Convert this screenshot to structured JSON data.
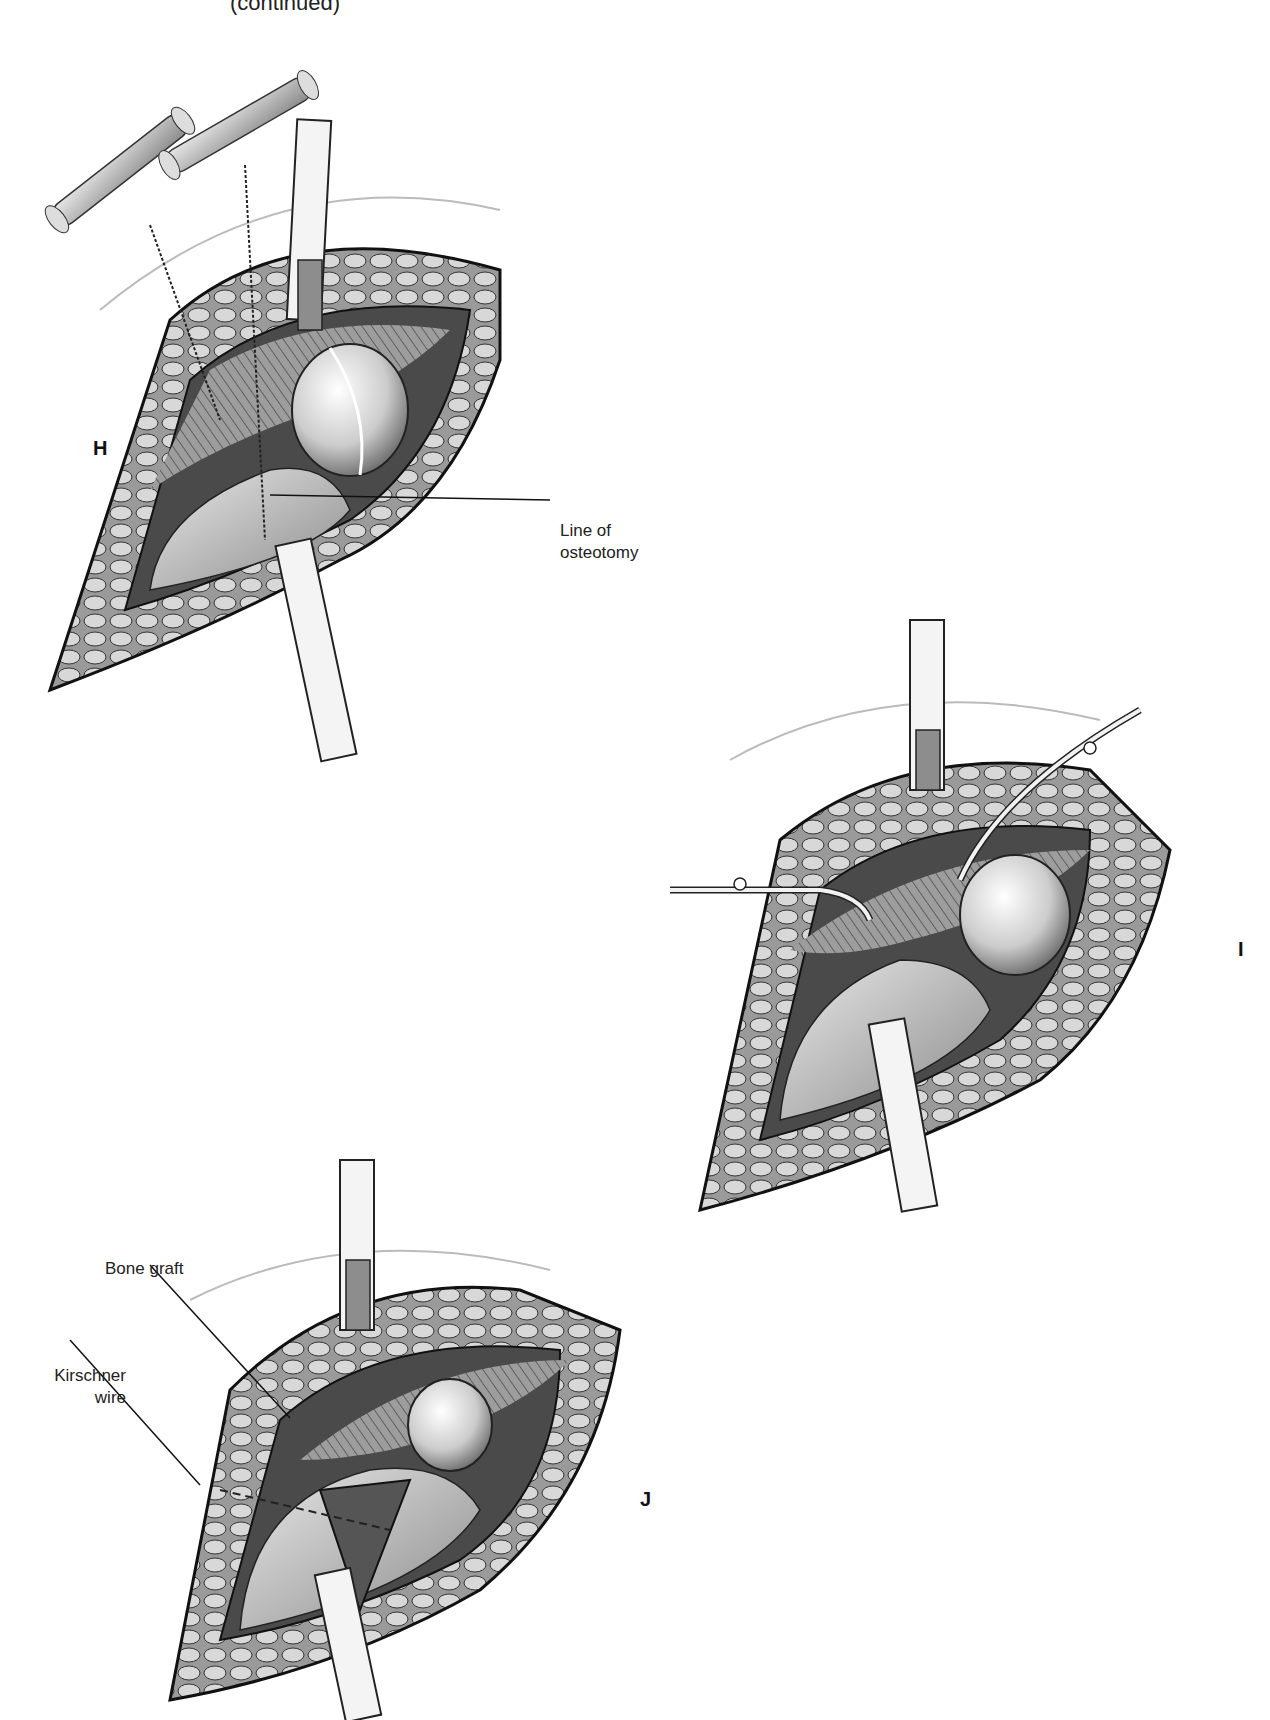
{
  "page": {
    "header_fragment": "(continued)"
  },
  "figures": [
    {
      "id": "H",
      "panel_label": "H",
      "callouts": [
        {
          "text_line1": "Line of",
          "text_line2": "osteotomy"
        }
      ]
    },
    {
      "id": "I",
      "panel_label": "I",
      "callouts": []
    },
    {
      "id": "J",
      "panel_label": "J",
      "callouts": [
        {
          "text_line1": "Bone graft",
          "text_line2": ""
        },
        {
          "text_line1": "Kirschner",
          "text_line2": "wire"
        }
      ]
    }
  ],
  "colors": {
    "ink": "#1a1a1a",
    "mid_gray": "#7a7a7a",
    "light_gray": "#cfcfcf",
    "paper": "#ffffff"
  }
}
